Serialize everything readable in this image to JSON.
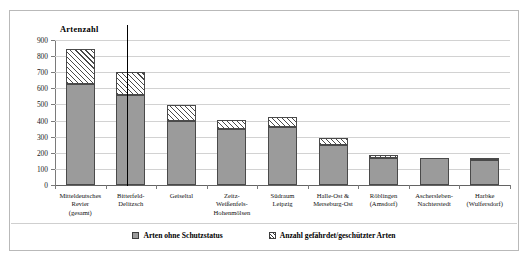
{
  "chart_data": {
    "type": "bar",
    "subtype": "stacked",
    "title": "",
    "ylabel": "Artenzahl",
    "xlabel": "",
    "ylim": [
      0,
      900
    ],
    "ytick_step": 100,
    "yticks": [
      0,
      100,
      200,
      300,
      400,
      500,
      600,
      700,
      800,
      900
    ],
    "grid": true,
    "legend_position": "bottom",
    "categories": [
      "Mitteldeutsches Revier (gesamt)",
      "Bitterfeld-Delitzsch",
      "Geiseltal",
      "Zeitz-Weißenfels-Hohenmölsen",
      "Südraum Leipzig",
      "Halle-Ost & Merseburg-Ost",
      "Röblingen (Amsdorf)",
      "Aschersleben-Nachterstedt",
      "Harbke (Wulfersdorf)"
    ],
    "category_lines": [
      [
        "Mitteldeutsches",
        "Revier",
        "(gesamt)"
      ],
      [
        "Bitterfeld-",
        "Delitzsch"
      ],
      [
        "Geiseltal"
      ],
      [
        "Zeitz-",
        "Weißenfels-",
        "Hohenmölsen"
      ],
      [
        "Südraum",
        "Leipzig"
      ],
      [
        "Halle-Ost &",
        "Merseburg-Ost"
      ],
      [
        "Röblingen",
        "(Amsdorf)"
      ],
      [
        "Aschersleben-",
        "Nachterstedt"
      ],
      [
        "Harbke",
        "(Wulfersdorf)"
      ]
    ],
    "series": [
      {
        "name": "Arten ohne Schutzstatus",
        "color": "#9b9b9b",
        "pattern": "solid",
        "values": [
          630,
          560,
          400,
          350,
          360,
          250,
          170,
          165,
          155
        ]
      },
      {
        "name": "Anzahl gefährdet/geschützter Arten",
        "color": "#ffffff",
        "pattern": "diagonal-hatch",
        "values": [
          215,
          140,
          98,
          55,
          60,
          40,
          15,
          0,
          8
        ]
      }
    ],
    "totals": [
      845,
      700,
      498,
      405,
      420,
      290,
      185,
      165,
      163
    ],
    "annotations": {
      "vertical_divider_after_category_index": 0
    }
  },
  "legend": {
    "items": [
      {
        "label": "Arten ohne Schutzstatus",
        "swatch": "solid-gray-swatch"
      },
      {
        "label": "Anzahl gefährdet/geschützter Arten",
        "swatch": "hatched-swatch"
      }
    ]
  }
}
